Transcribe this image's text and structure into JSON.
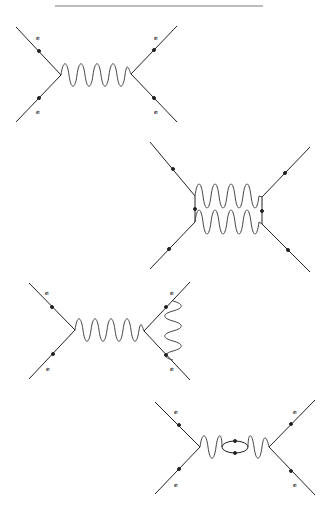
{
  "colors": {
    "line": "#222222",
    "photon": "#444444",
    "background": "#ffffff",
    "rule": "#bdbdbd"
  },
  "diagrams": [
    {
      "name": "tree-level-photon-exchange",
      "labels": [
        "e",
        "e",
        "e",
        "e"
      ]
    },
    {
      "name": "two-photon-exchange-box",
      "labels": []
    },
    {
      "name": "vertex-correction",
      "labels": [
        "e",
        "e",
        "e",
        "e"
      ]
    },
    {
      "name": "vacuum-polarization-loop",
      "labels": [
        "e",
        "e",
        "e",
        "e"
      ]
    }
  ]
}
